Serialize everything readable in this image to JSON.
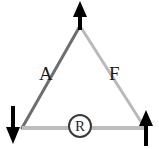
{
  "figure": {
    "type": "diagram",
    "background_color": "#ffffff",
    "width": 159,
    "height": 149,
    "edges": [
      {
        "id": "left-edge",
        "label": "A",
        "color": "#6e6e6e",
        "from": "bottom-left-vertex",
        "to": "apex-vertex"
      },
      {
        "id": "right-edge",
        "label": "F",
        "color": "#b9b9b9",
        "from": "apex-vertex",
        "to": "bottom-right-vertex"
      },
      {
        "id": "bottom-edge",
        "label": "R",
        "color": "#bdbdbd",
        "from": "bottom-left-vertex",
        "to": "bottom-right-vertex"
      }
    ],
    "arrows": [
      {
        "id": "apex-arrow",
        "direction": "up",
        "color": "#000000",
        "vertex": "apex-vertex"
      },
      {
        "id": "bottom-left-arrow",
        "direction": "down",
        "color": "#000000",
        "vertex": "bottom-left-vertex"
      },
      {
        "id": "bottom-right-arrow",
        "direction": "up",
        "color": "#000000",
        "vertex": "bottom-right-vertex"
      }
    ],
    "labels": {
      "left": "A",
      "right": "F",
      "center_circled": "R"
    }
  }
}
